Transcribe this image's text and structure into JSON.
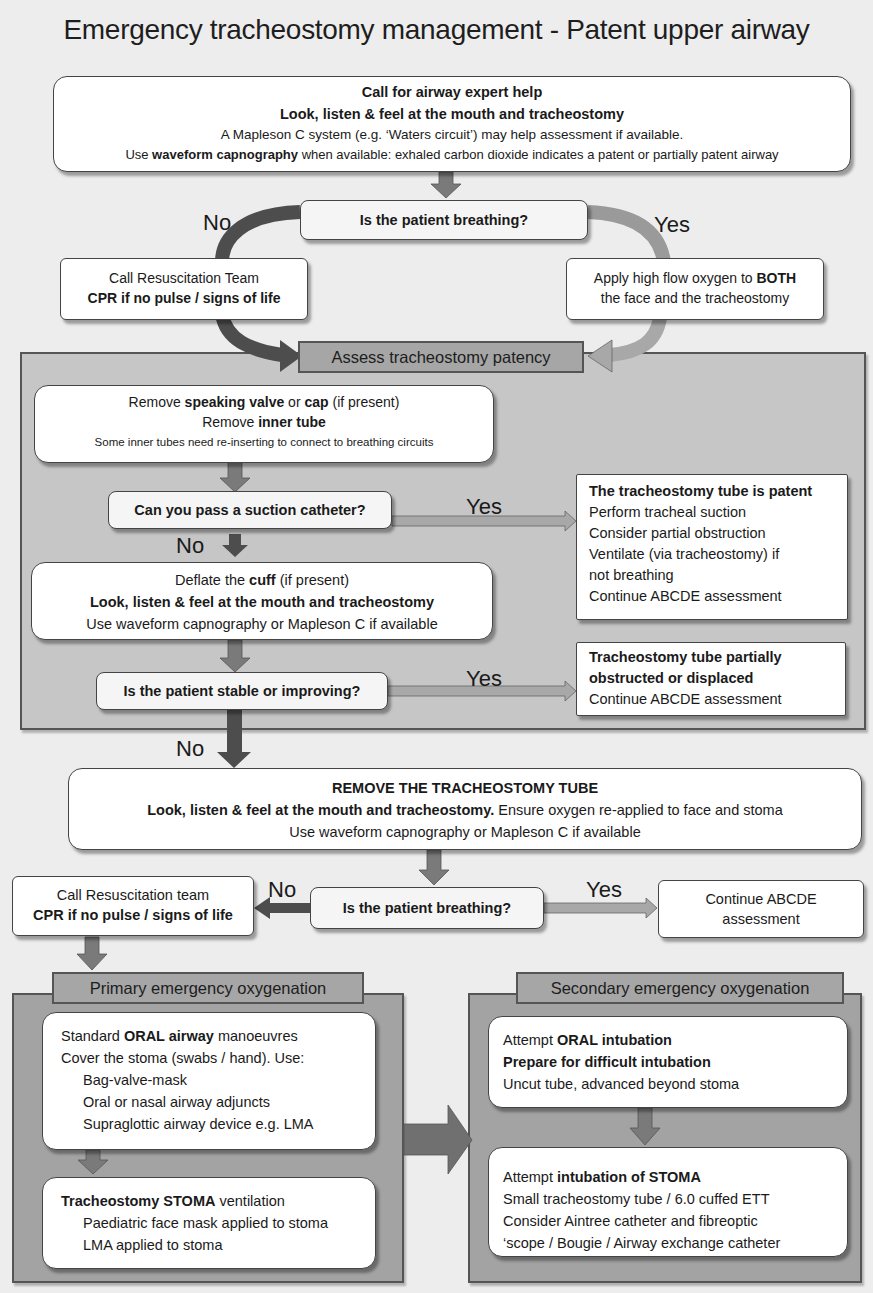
{
  "title": "Emergency tracheostomy management - Patent upper airway",
  "colors": {
    "background": "#ededed",
    "box_fill": "#ffffff",
    "assess_region": "#c6c6c6",
    "oxygenation_region": "#a3a3a3",
    "arrow_dark": "#4d4d4d",
    "arrow_mid": "#7a7a7a",
    "arrow_light": "#a8a8a8"
  },
  "start_box": {
    "line1": "Call for airway expert help",
    "line2": "Look, listen & feel at the mouth and tracheostomy",
    "line3": "A Mapleson C system (e.g. ‘Waters circuit’) may help assessment if available.",
    "line4_prefix": "Use ",
    "line4_bold": "waveform capnography",
    "line4_suffix": " when available:  exhaled carbon dioxide indicates a patent or partially patent airway"
  },
  "breathing_q1": {
    "question": "Is the patient breathing?",
    "no_label": "No",
    "yes_label": "Yes",
    "no_box": {
      "line1": "Call Resuscitation Team",
      "line2": "CPR if no pulse / signs of life"
    },
    "yes_box": {
      "line1_prefix": "Apply high flow oxygen to ",
      "line1_bold": "BOTH",
      "line2": "the face and the tracheostomy"
    }
  },
  "assess": {
    "header": "Assess tracheostomy patency",
    "remove_box": {
      "l1_a": "Remove ",
      "l1_b": "speaking valve",
      "l1_c": " or ",
      "l1_d": "cap",
      "l1_e": " (if present)",
      "l2_a": "Remove ",
      "l2_b": "inner tube",
      "l3": "Some inner tubes need re-inserting to connect to breathing circuits"
    },
    "suction_q": "Can you pass a suction catheter?",
    "suction_yes": "Yes",
    "suction_no": "No",
    "patent_box": {
      "title": "The tracheostomy tube is patent",
      "lines": [
        "Perform tracheal suction",
        "Consider partial obstruction",
        "Ventilate (via tracheostomy) if",
        "not breathing",
        "Continue ABCDE assessment"
      ]
    },
    "cuff_box": {
      "l1_a": "Deflate the ",
      "l1_b": "cuff",
      "l1_c": " (if present)",
      "l2": "Look, listen & feel at the mouth and tracheostomy",
      "l3": "Use waveform capnography or Mapleson C if available"
    },
    "stable_q": "Is the patient stable or improving?",
    "stable_yes": "Yes",
    "stable_no": "No",
    "partial_box": {
      "title1": "Tracheostomy tube partially",
      "title2": "obstructed or displaced",
      "line": "Continue ABCDE assessment"
    }
  },
  "remove_tube_box": {
    "l1": "REMOVE THE TRACHEOSTOMY TUBE",
    "l2_bold": "Look, listen & feel at the mouth and tracheostomy.",
    "l2_rest": " Ensure oxygen re-applied to face and stoma",
    "l3": "Use waveform capnography or Mapleson C if available"
  },
  "breathing_q2": {
    "question": "Is the patient breathing?",
    "no_label": "No",
    "yes_label": "Yes",
    "no_box": {
      "line1": "Call Resuscitation team",
      "line2": "CPR if no pulse / signs of life"
    },
    "yes_box": {
      "line1": "Continue ABCDE",
      "line2": "assessment"
    }
  },
  "primary": {
    "header": "Primary emergency oxygenation",
    "box1": {
      "l1_a": "Standard ",
      "l1_b": "ORAL airway",
      "l1_c": " manoeuvres",
      "l2": "Cover the stoma (swabs / hand). Use:",
      "items": [
        "Bag-valve-mask",
        "Oral or nasal airway adjuncts",
        "Supraglottic airway device e.g. LMA"
      ]
    },
    "box2": {
      "l1_b": "Tracheostomy STOMA",
      "l1_c": " ventilation",
      "items": [
        "Paediatric face mask applied to stoma",
        "LMA applied to stoma"
      ]
    }
  },
  "secondary": {
    "header": "Secondary emergency oxygenation",
    "box1": {
      "l1_a": "Attempt ",
      "l1_b": "ORAL intubation",
      "l2": "Prepare for difficult intubation",
      "l3": "Uncut tube, advanced beyond stoma"
    },
    "box2": {
      "l1_a": "Attempt ",
      "l1_b": "intubation of STOMA",
      "lines": [
        "Small tracheostomy tube / 6.0 cuffed ETT",
        "Consider Aintree catheter and fibreoptic",
        "‘scope / Bougie / Airway exchange catheter"
      ]
    }
  }
}
